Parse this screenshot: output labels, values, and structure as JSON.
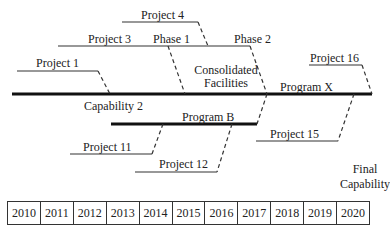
{
  "diagram": {
    "main_line_label": "Program X",
    "branch_label": "Program B",
    "capability_label": "Capability 2",
    "consolidated": [
      "Consolidated",
      "Facilities"
    ],
    "final_capability": [
      "Final",
      "Capability"
    ],
    "projects": {
      "p1": "Project 1",
      "p3": "Project 3",
      "p4": "Project 4",
      "p11": "Project 11",
      "p12": "Project 12",
      "p15": "Project 15",
      "p16": "Project 16"
    },
    "phases": {
      "phase1": "Phase 1",
      "phase2": "Phase 2"
    },
    "colors": {
      "line": "#111111",
      "text": "#222222"
    }
  },
  "timeline": {
    "years": [
      "2010",
      "2011",
      "2012",
      "2013",
      "2014",
      "2015",
      "2016",
      "2017",
      "2018",
      "2019",
      "2020"
    ]
  }
}
